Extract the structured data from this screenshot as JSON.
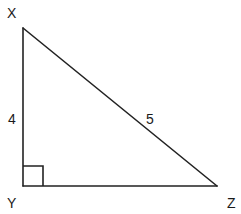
{
  "figure": {
    "type": "right-triangle",
    "vertices": [
      {
        "name": "X",
        "label": "X"
      },
      {
        "name": "Y",
        "label": "Y"
      },
      {
        "name": "Z",
        "label": "Z"
      }
    ],
    "sides": [
      {
        "from": "X",
        "to": "Y",
        "label": "4"
      },
      {
        "from": "X",
        "to": "Z",
        "label": "5"
      },
      {
        "from": "Y",
        "to": "Z",
        "label": ""
      }
    ],
    "right_angle_at": "Y",
    "colors": {
      "stroke": "#222222",
      "text": "#1a1a1a",
      "background": "#ffffff"
    }
  }
}
